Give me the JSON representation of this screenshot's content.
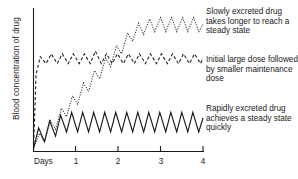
{
  "axes": {
    "ylabel": "Blood concentration of drug",
    "xlabel": "Days",
    "xticks": [
      "1",
      "2",
      "3",
      "4"
    ]
  },
  "annotations": {
    "slow": "Slowly excreted drug takes longer to reach a steady state",
    "initial": "Initial large dose followed by smaller maintenance dose",
    "rapid": "Rapidly excreted drug achieves a steady state quickly"
  },
  "chart_data": {
    "type": "line",
    "title": "",
    "xlabel": "Days",
    "ylabel": "Blood concentration of drug",
    "xlim": [
      0,
      4
    ],
    "ylim": [
      0,
      1
    ],
    "grid": false,
    "legend": "annotations-right",
    "xticks": [
      1,
      2,
      3,
      4
    ],
    "axis_color": "#1a1a1a",
    "series": [
      {
        "name": "Rapidly excreted drug achieves a steady state quickly",
        "style": "solid",
        "color": "#1a1a1a",
        "description": "Sawtooth rising over first two doses then oscillating at a constant low steady-state band",
        "x": [
          0.0,
          0.12,
          0.26,
          0.38,
          0.52,
          0.64,
          0.78,
          0.9,
          1.04,
          1.16,
          1.3,
          1.42,
          1.56,
          1.68,
          1.82,
          1.94,
          2.08,
          2.2,
          2.34,
          2.46,
          2.6,
          2.72,
          2.86,
          2.98,
          3.12,
          3.24,
          3.38,
          3.5,
          3.64,
          3.76,
          3.9,
          4.0
        ],
        "y": [
          0.02,
          0.17,
          0.07,
          0.22,
          0.11,
          0.26,
          0.14,
          0.28,
          0.14,
          0.28,
          0.14,
          0.28,
          0.14,
          0.28,
          0.14,
          0.28,
          0.14,
          0.28,
          0.14,
          0.28,
          0.14,
          0.28,
          0.14,
          0.28,
          0.14,
          0.28,
          0.14,
          0.28,
          0.14,
          0.28,
          0.14,
          0.24
        ]
      },
      {
        "name": "Initial large dose followed by smaller maintenance dose",
        "style": "dashed",
        "color": "#1a1a1a",
        "description": "Steep initial loading dose reaching plateau immediately, then small-amplitude maintenance oscillation",
        "x": [
          0.0,
          0.06,
          0.16,
          0.3,
          0.42,
          0.56,
          0.68,
          0.82,
          0.94,
          1.08,
          1.2,
          1.34,
          1.46,
          1.6,
          1.72,
          1.86,
          1.98,
          2.12,
          2.24,
          2.38,
          2.5,
          2.64,
          2.76,
          2.9,
          3.02,
          3.16,
          3.28,
          3.42,
          3.54,
          3.68,
          3.8,
          3.94,
          4.0
        ],
        "y": [
          0.02,
          0.55,
          0.68,
          0.63,
          0.7,
          0.63,
          0.7,
          0.63,
          0.7,
          0.63,
          0.7,
          0.63,
          0.72,
          0.63,
          0.7,
          0.63,
          0.7,
          0.63,
          0.7,
          0.63,
          0.7,
          0.63,
          0.7,
          0.63,
          0.7,
          0.63,
          0.7,
          0.63,
          0.7,
          0.63,
          0.7,
          0.63,
          0.67
        ]
      },
      {
        "name": "Slowly excreted drug takes longer to reach a steady state",
        "style": "dotted",
        "color": "#1a1a1a",
        "description": "Gradual accumulation with sawtooth oscillation, reaching a high steady state near day 2.5",
        "x": [
          0.0,
          0.14,
          0.26,
          0.4,
          0.52,
          0.66,
          0.78,
          0.92,
          1.04,
          1.18,
          1.3,
          1.44,
          1.56,
          1.7,
          1.82,
          1.96,
          2.08,
          2.22,
          2.34,
          2.48,
          2.6,
          2.74,
          2.86,
          3.0,
          3.12,
          3.26,
          3.38,
          3.52,
          3.64,
          3.78,
          3.9,
          4.0
        ],
        "y": [
          0.02,
          0.13,
          0.07,
          0.22,
          0.16,
          0.31,
          0.25,
          0.4,
          0.34,
          0.49,
          0.43,
          0.58,
          0.52,
          0.67,
          0.61,
          0.76,
          0.7,
          0.85,
          0.79,
          0.92,
          0.84,
          0.95,
          0.86,
          0.96,
          0.86,
          0.96,
          0.86,
          0.96,
          0.86,
          0.96,
          0.86,
          0.91
        ]
      }
    ]
  }
}
